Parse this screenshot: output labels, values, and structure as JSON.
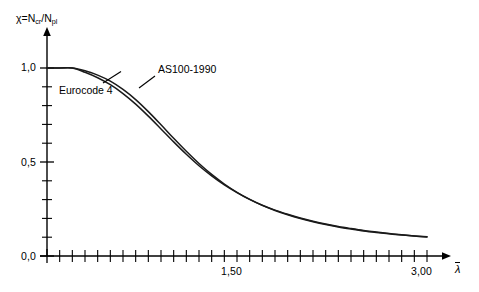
{
  "figure": {
    "background": "#ffffff",
    "ink_color": "#000000"
  },
  "axes": {
    "y_axis_label": "χ=N",
    "y_axis_label_sub1": "cr",
    "y_axis_label_sep": "/N",
    "y_axis_label_sub2": "pl",
    "x_axis_label": "λ",
    "y_ticks": [
      {
        "value": 0.0,
        "label": "0,0"
      },
      {
        "value": 0.5,
        "label": "0,5"
      },
      {
        "value": 1.0,
        "label": "1,0"
      }
    ],
    "x_ticks": [
      {
        "value": 1.5,
        "label": "1,50"
      },
      {
        "value": 3.0,
        "label": "3,00"
      }
    ],
    "x_minor_tick_step": 0.1,
    "y_minor_tick_step": 0.1,
    "xlim": [
      0,
      3.15
    ],
    "ylim": [
      0,
      1.12
    ]
  },
  "annotations": {
    "eurocode_label": "Eurocode 4",
    "as100_label": "AS100-1990"
  },
  "chart_data": {
    "type": "line",
    "title": "",
    "subtitle": "",
    "xlabel": "λ̄",
    "ylabel": "χ=Ncr/Npl",
    "xlim": [
      0,
      3.15
    ],
    "ylim": [
      0,
      1.12
    ],
    "grid": false,
    "legend": "inline-annotations",
    "x": [
      0.0,
      0.1,
      0.2,
      0.3,
      0.4,
      0.5,
      0.6,
      0.7,
      0.8,
      0.9,
      1.0,
      1.1,
      1.2,
      1.3,
      1.4,
      1.5,
      1.6,
      1.7,
      1.8,
      1.9,
      2.0,
      2.1,
      2.2,
      2.3,
      2.4,
      2.5,
      2.6,
      2.7,
      2.8,
      2.9,
      3.0
    ],
    "series": [
      {
        "name": "AS100-1990",
        "values": [
          1.0,
          1.0,
          1.0,
          0.985,
          0.962,
          0.93,
          0.886,
          0.832,
          0.768,
          0.698,
          0.626,
          0.557,
          0.492,
          0.434,
          0.383,
          0.339,
          0.301,
          0.269,
          0.242,
          0.219,
          0.199,
          0.182,
          0.167,
          0.154,
          0.143,
          0.133,
          0.125,
          0.118,
          0.112,
          0.106,
          0.101
        ]
      },
      {
        "name": "Eurocode 4",
        "values": [
          1.0,
          1.0,
          1.0,
          0.977,
          0.948,
          0.911,
          0.864,
          0.808,
          0.744,
          0.676,
          0.607,
          0.541,
          0.48,
          0.426,
          0.378,
          0.337,
          0.301,
          0.27,
          0.244,
          0.222,
          0.202,
          0.185,
          0.17,
          0.157,
          0.146,
          0.136,
          0.128,
          0.12,
          0.113,
          0.107,
          0.102
        ]
      }
    ],
    "annotations": [
      {
        "text": "Eurocode 4",
        "target_x": 0.62,
        "target_y": 0.88
      },
      {
        "text": "AS100-1990",
        "target_x": 0.88,
        "target_y": 0.73
      }
    ]
  }
}
